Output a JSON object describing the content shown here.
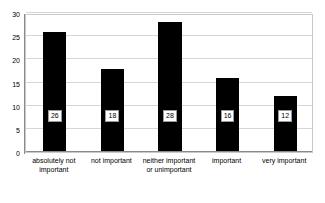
{
  "chart_data": {
    "type": "bar",
    "title": "",
    "subtitle": "",
    "xlabel": "",
    "ylabel": "",
    "ylim": [
      0,
      30
    ],
    "yticks": [
      0,
      5,
      10,
      15,
      20,
      25,
      30
    ],
    "ytick_labels": [
      "0",
      "5",
      "10",
      "15",
      "20",
      "25",
      "30"
    ],
    "grid": true,
    "legend": false,
    "legend_position": "none",
    "bar_color": "#000000",
    "gridline_color": "#d6d6d6",
    "plot_border_color": "#c9c9c9",
    "axis_color": "#8a8a8a",
    "background_color": "#ffffff",
    "data_label_text_color": "#000000",
    "data_label_box_color": "#ffffff",
    "categories": [
      "absolutely not important",
      "not important",
      "neither important or unimportant",
      "important",
      "very important"
    ],
    "category_label_lines": [
      [
        "absolutely not",
        "important"
      ],
      [
        "not important",
        ""
      ],
      [
        "neither important",
        "or unimportant"
      ],
      [
        "important",
        ""
      ],
      [
        "very important",
        ""
      ]
    ],
    "values": [
      26,
      18,
      28,
      16,
      12
    ],
    "data_labels": [
      "26",
      "18",
      "28",
      "16",
      "12"
    ]
  }
}
